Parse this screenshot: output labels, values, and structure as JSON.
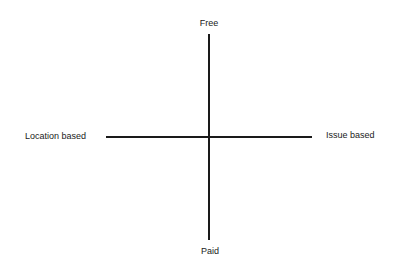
{
  "diagram": {
    "type": "quadrant",
    "axes": {
      "vertical": {
        "top_label": "Free",
        "bottom_label": "Paid"
      },
      "horizontal": {
        "left_label": "Location based",
        "right_label": "Issue based"
      }
    }
  }
}
